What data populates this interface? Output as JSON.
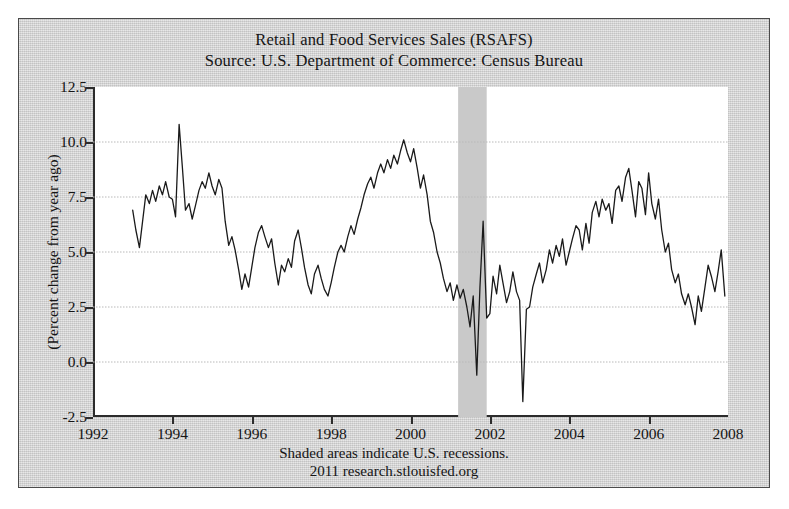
{
  "figure": {
    "background_color": "#d2d2d2",
    "plot_background_color": "#ffffff",
    "border_color": "#4a4a4a"
  },
  "chart_data": {
    "type": "line",
    "title": "Retail and Food Services Sales (RSAFS)",
    "subtitle": "Source: U.S. Department of Commerce: Census Bureau",
    "xlabel": "",
    "ylabel": "(Percent change from year ago)",
    "xlim": [
      1992,
      2008
    ],
    "ylim": [
      -2.5,
      12.5
    ],
    "xticks": [
      1992,
      1994,
      1996,
      1998,
      2000,
      2002,
      2004,
      2006,
      2008
    ],
    "xtick_labels": [
      "1992",
      "1994",
      "1996",
      "1998",
      "2000",
      "2002",
      "2004",
      "2006",
      "2008"
    ],
    "yticks": [
      -2.5,
      0.0,
      2.5,
      5.0,
      7.5,
      10.0,
      12.5
    ],
    "ytick_labels": [
      "-2.5",
      "0.0",
      "2.5",
      "5.0",
      "7.5",
      "10.0",
      "12.5"
    ],
    "grid": true,
    "grid_color": "#b9b9b9",
    "legend": "none",
    "line_color": "#1a1a1a",
    "line_width": 1.3,
    "footer_note": "Shaded areas indicate U.S. recessions.",
    "footer_credit": "2011 research.stlouisfed.org",
    "shaded_regions": [
      {
        "label": "2001 recession",
        "start": 2001.2,
        "end": 2001.92,
        "color": "#c9c9c9"
      }
    ],
    "series": [
      {
        "name": "Retail and Food Services Sales, percent change from year ago",
        "x": [
          1993.0,
          1993.08,
          1993.17,
          1993.25,
          1993.33,
          1993.42,
          1993.5,
          1993.58,
          1993.67,
          1993.75,
          1993.83,
          1993.92,
          1994.0,
          1994.08,
          1994.17,
          1994.25,
          1994.33,
          1994.42,
          1994.5,
          1994.58,
          1994.67,
          1994.75,
          1994.83,
          1994.92,
          1995.0,
          1995.08,
          1995.17,
          1995.25,
          1995.33,
          1995.42,
          1995.5,
          1995.58,
          1995.67,
          1995.75,
          1995.83,
          1995.92,
          1996.0,
          1996.08,
          1996.17,
          1996.25,
          1996.33,
          1996.42,
          1996.5,
          1996.58,
          1996.67,
          1996.75,
          1996.83,
          1996.92,
          1997.0,
          1997.08,
          1997.17,
          1997.25,
          1997.33,
          1997.42,
          1997.5,
          1997.58,
          1997.67,
          1997.75,
          1997.83,
          1997.92,
          1998.0,
          1998.08,
          1998.17,
          1998.25,
          1998.33,
          1998.42,
          1998.5,
          1998.58,
          1998.67,
          1998.75,
          1998.83,
          1998.92,
          1999.0,
          1999.08,
          1999.17,
          1999.25,
          1999.33,
          1999.42,
          1999.5,
          1999.58,
          1999.67,
          1999.75,
          1999.83,
          1999.92,
          2000.0,
          2000.08,
          2000.17,
          2000.25,
          2000.33,
          2000.42,
          2000.5,
          2000.58,
          2000.67,
          2000.75,
          2000.83,
          2000.92,
          2001.0,
          2001.08,
          2001.17,
          2001.25,
          2001.33,
          2001.42,
          2001.5,
          2001.58,
          2001.67,
          2001.75,
          2001.83,
          2001.92,
          2002.0,
          2002.08,
          2002.17,
          2002.25,
          2002.33,
          2002.42,
          2002.5,
          2002.58,
          2002.67,
          2002.75,
          2002.83,
          2002.92,
          2003.0,
          2003.08,
          2003.17,
          2003.25,
          2003.33,
          2003.42,
          2003.5,
          2003.58,
          2003.67,
          2003.75,
          2003.83,
          2003.92,
          2004.0,
          2004.08,
          2004.17,
          2004.25,
          2004.33,
          2004.42,
          2004.5,
          2004.58,
          2004.67,
          2004.75,
          2004.83,
          2004.92,
          2005.0,
          2005.08,
          2005.17,
          2005.25,
          2005.33,
          2005.42,
          2005.5,
          2005.58,
          2005.67,
          2005.75,
          2005.83,
          2005.92,
          2006.0,
          2006.08,
          2006.17,
          2006.25,
          2006.33,
          2006.42,
          2006.5,
          2006.58,
          2006.67,
          2006.75,
          2006.83,
          2006.92,
          2007.0,
          2007.08,
          2007.17,
          2007.25,
          2007.33,
          2007.42,
          2007.5,
          2007.58,
          2007.67,
          2007.75,
          2007.83,
          2007.92
        ],
        "y": [
          6.9,
          6.0,
          5.2,
          6.4,
          7.6,
          7.2,
          7.8,
          7.3,
          8.0,
          7.6,
          8.2,
          7.5,
          7.4,
          6.6,
          10.8,
          8.9,
          6.9,
          7.2,
          6.5,
          7.1,
          7.8,
          8.2,
          7.9,
          8.6,
          8.0,
          7.6,
          8.3,
          7.9,
          6.4,
          5.3,
          5.7,
          5.1,
          4.2,
          3.3,
          4.0,
          3.4,
          4.3,
          5.2,
          5.9,
          6.2,
          5.7,
          5.2,
          5.6,
          4.5,
          3.5,
          4.4,
          4.1,
          4.7,
          4.3,
          5.5,
          6.0,
          5.2,
          4.3,
          3.5,
          3.1,
          4.0,
          4.4,
          3.8,
          3.3,
          3.0,
          3.6,
          4.3,
          5.0,
          5.3,
          5.0,
          5.7,
          6.2,
          5.8,
          6.5,
          7.0,
          7.6,
          8.1,
          8.4,
          7.9,
          8.6,
          9.0,
          8.6,
          9.2,
          8.8,
          9.4,
          9.0,
          9.6,
          10.1,
          9.5,
          9.1,
          9.7,
          8.8,
          7.9,
          8.5,
          7.6,
          6.4,
          5.9,
          5.0,
          4.5,
          3.8,
          3.2,
          3.6,
          2.8,
          3.5,
          2.9,
          3.3,
          2.5,
          1.6,
          3.0,
          -0.6,
          3.4,
          6.4,
          2.0,
          2.2,
          3.9,
          3.1,
          4.4,
          3.6,
          2.7,
          3.2,
          4.1,
          3.2,
          2.8,
          -1.8,
          2.4,
          2.5,
          3.4,
          4.0,
          4.5,
          3.6,
          4.2,
          5.1,
          4.5,
          5.3,
          4.8,
          5.6,
          4.4,
          5.0,
          5.6,
          6.2,
          6.0,
          5.1,
          6.3,
          5.4,
          6.8,
          7.3,
          6.6,
          7.4,
          6.9,
          7.2,
          6.3,
          7.8,
          8.0,
          7.3,
          8.4,
          8.8,
          7.8,
          6.6,
          8.2,
          7.9,
          6.7,
          8.6,
          7.2,
          6.5,
          7.4,
          6.0,
          5.0,
          5.4,
          4.2,
          3.6,
          4.0,
          3.1,
          2.6,
          3.1,
          2.5,
          1.7,
          3.0,
          2.3,
          3.4,
          4.4,
          3.9,
          3.2,
          4.1,
          5.1,
          3.0
        ]
      }
    ]
  }
}
